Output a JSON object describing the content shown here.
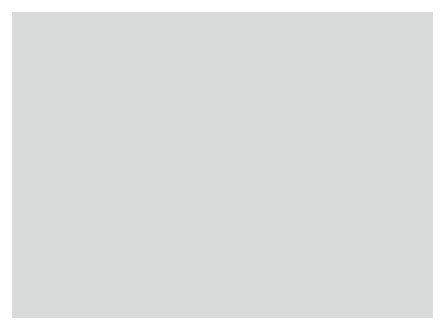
{
  "figure": {
    "background_color": "#d9dbdb",
    "plot_background_color": "#ffffff",
    "frame_color": "#8c8c8c"
  },
  "chart_data": {
    "type": "line",
    "title": "",
    "xlabel": "Estimated mean IQ",
    "ylabel": "Odds ratio with 95% CI",
    "xlim": [
      57,
      142
    ],
    "ylim": [
      0.13,
      32
    ],
    "yscale": "log",
    "grid": "horizontal",
    "xticks": [
      60,
      80,
      100,
      120,
      140
    ],
    "xticklabels": [
      "60",
      "80",
      "100",
      "120",
      "140"
    ],
    "yticks": [
      0.2,
      0.5,
      1,
      2,
      5,
      10,
      20
    ],
    "yticklabels": [
      "0.2",
      "0.5",
      "1",
      "2",
      "5",
      "10",
      "20"
    ],
    "legend_position": "below",
    "series": [
      {
        "name": "Reichenberg",
        "style": "dashed",
        "color": "#1a1a1a",
        "width": 1.3,
        "x": [
          64,
          79,
          94,
          120,
          134
        ],
        "y": [
          6.2,
          3.0,
          1.65,
          0.78,
          1.9
        ]
      },
      {
        "name": "Gunnell",
        "style": "dotted",
        "color": "#2b2b2b",
        "width": 1.1,
        "x": [
          65,
          81,
          95,
          124
        ],
        "y": [
          4.3,
          1.55,
          0.88,
          0.85
        ]
      },
      {
        "name": "Jones",
        "style": "solid",
        "color": "#4d4d4d",
        "width": 1.0,
        "x": [
          62,
          80,
          95,
          120,
          134
        ],
        "y": [
          5.4,
          5.0,
          1.75,
          1.2,
          2.7
        ]
      },
      {
        "name": "Zammit",
        "style": "solid",
        "color": "#1a1a1a",
        "width": 1.6,
        "x": [
          65,
          80,
          95,
          121,
          132
        ],
        "y": [
          4.9,
          2.1,
          1.3,
          0.6,
          0.45
        ]
      },
      {
        "name": "Tiihonen",
        "style": "solid",
        "color": "#a6a6a6",
        "width": 1.5,
        "x": [
          65,
          80,
          94,
          121,
          131
        ],
        "y": [
          3.6,
          2.4,
          1.45,
          0.62,
          0.33
        ]
      },
      {
        "name": "Pooled",
        "style": "solid",
        "color": "#000000",
        "width": 3.0,
        "x": [
          65,
          80,
          95,
          121,
          132
        ],
        "y": [
          4.9,
          2.3,
          1.35,
          0.6,
          0.67
        ]
      }
    ],
    "error_bars": [
      {
        "series": "Jones",
        "x": 62,
        "y": 5.4,
        "low": 0.62,
        "high": 30.0,
        "color": "#8c8c8c",
        "width": 1.2
      },
      {
        "series": "Gunnell",
        "x": 65,
        "y": 4.3,
        "low": 2.05,
        "high": 9.6,
        "color": "#2b2b2b",
        "width": 1.1,
        "style": "dotted"
      },
      {
        "series": "Zammit",
        "x": 65,
        "y": 4.9,
        "low": 2.9,
        "high": 6.5,
        "color": "#1a1a1a",
        "width": 2.2
      },
      {
        "series": "Pooled",
        "x": 65,
        "y": 4.9,
        "low": 3.2,
        "high": 6.3,
        "color": "#000000",
        "width": 3.0
      },
      {
        "series": "Jones",
        "x": 80,
        "y": 5.0,
        "low": 1.45,
        "high": 14.0,
        "color": "#8c8c8c",
        "width": 1.2
      },
      {
        "series": "Gunnell",
        "x": 81,
        "y": 1.55,
        "low": 0.52,
        "high": 4.4,
        "color": "#2b2b2b",
        "width": 1.1,
        "style": "dotted"
      },
      {
        "series": "Zammit",
        "x": 80,
        "y": 2.1,
        "low": 1.5,
        "high": 3.0,
        "color": "#1a1a1a",
        "width": 2.2
      },
      {
        "series": "Pooled",
        "x": 80,
        "y": 2.3,
        "low": 1.7,
        "high": 3.1,
        "color": "#000000",
        "width": 3.0
      },
      {
        "series": "Jones",
        "x": 94,
        "y": 1.75,
        "low": 0.52,
        "high": 5.8,
        "color": "#8c8c8c",
        "width": 1.2
      },
      {
        "series": "Gunnell",
        "x": 95,
        "y": 0.88,
        "low": 0.4,
        "high": 1.9,
        "color": "#2b2b2b",
        "width": 1.1,
        "style": "dotted"
      },
      {
        "series": "Pooled",
        "x": 95,
        "y": 1.35,
        "low": 1.05,
        "high": 1.75,
        "color": "#000000",
        "width": 3.0
      },
      {
        "series": "Jones",
        "x": 120,
        "y": 1.2,
        "low": 0.21,
        "high": 6.6,
        "color": "#8c8c8c",
        "width": 1.2
      },
      {
        "series": "Gunnell",
        "x": 124,
        "y": 0.85,
        "low": 0.16,
        "high": 3.6,
        "color": "#2b2b2b",
        "width": 1.1,
        "style": "dotted"
      },
      {
        "series": "Pooled",
        "x": 121,
        "y": 0.6,
        "low": 0.42,
        "high": 0.86,
        "color": "#000000",
        "width": 3.0
      },
      {
        "series": "Jones",
        "x": 134,
        "y": 2.7,
        "low": 0.31,
        "high": 22.0,
        "color": "#8c8c8c",
        "width": 1.2
      },
      {
        "series": "Tiihonen",
        "x": 131,
        "y": 0.33,
        "low": 0.16,
        "high": 0.72,
        "color": "#a6a6a6",
        "width": 1.8
      },
      {
        "series": "Pooled",
        "x": 132,
        "y": 0.67,
        "low": 0.21,
        "high": 1.35,
        "color": "#000000",
        "width": 3.0
      }
    ]
  },
  "legend": {
    "entries": [
      {
        "label": "Reichenberg",
        "style": "dashed",
        "color": "#1a1a1a",
        "width": 1.4
      },
      {
        "label": "Gunnell",
        "style": "dotted",
        "color": "#2b2b2b",
        "width": 1.2
      },
      {
        "label": "Jones",
        "style": "solid",
        "color": "#4d4d4d",
        "width": 1.0
      },
      {
        "label": "Zammit",
        "style": "solid",
        "color": "#1a1a1a",
        "width": 1.7
      },
      {
        "label": "Tiihonen",
        "style": "solid",
        "color": "#a6a6a6",
        "width": 1.5
      },
      {
        "label": "Pooled",
        "style": "solid",
        "color": "#000000",
        "width": 3.0
      }
    ]
  }
}
